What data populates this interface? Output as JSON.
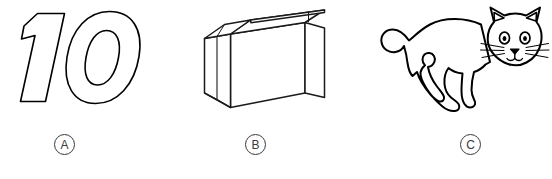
{
  "figure": {
    "background_color": "#ffffff",
    "stroke_color": "#000000",
    "label_color": "#3a3a3a",
    "panels": [
      {
        "id": "panel-a",
        "label": "A",
        "label_name": "option-label-a",
        "illustration_name": "number-ten-outline-illustration",
        "illustration_alt": "outlined italic numeral 10"
      },
      {
        "id": "panel-b",
        "label": "B",
        "label_name": "option-label-b",
        "illustration_name": "paper-bag-illustration",
        "illustration_alt": "open paper bag line drawing"
      },
      {
        "id": "panel-c",
        "label": "C",
        "label_name": "option-label-c",
        "illustration_name": "cat-illustration",
        "illustration_alt": "cat line drawing"
      }
    ]
  }
}
